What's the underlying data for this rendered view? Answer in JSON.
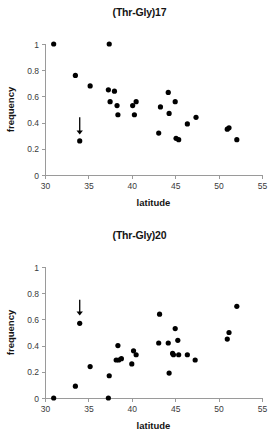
{
  "figure": {
    "background_color": "#ffffff",
    "point_color": "#000000",
    "axis_color": "#9a9a9a",
    "text_color": "#141414"
  },
  "chart_data": [
    {
      "type": "scatter",
      "title": "(Thr-Gly)17",
      "xlabel": "latitude",
      "ylabel": "frequency",
      "xlim": [
        30,
        55
      ],
      "ylim": [
        0,
        1
      ],
      "xticks": [
        30,
        35,
        40,
        45,
        50,
        55
      ],
      "xtick_labels": [
        "30",
        "35",
        "40",
        "45",
        "50",
        "55"
      ],
      "yticks": [
        0,
        0.2,
        0.4,
        0.6,
        0.8,
        1
      ],
      "ytick_labels": [
        "0",
        "0.2",
        "0.4",
        "0.6",
        "0.8",
        "1"
      ],
      "grid": false,
      "legend": "none",
      "trend": "negative",
      "points": [
        {
          "x": 31.0,
          "y": 1.0
        },
        {
          "x": 33.5,
          "y": 0.76
        },
        {
          "x": 34.0,
          "y": 0.26
        },
        {
          "x": 35.2,
          "y": 0.68
        },
        {
          "x": 37.3,
          "y": 0.65
        },
        {
          "x": 37.4,
          "y": 1.0
        },
        {
          "x": 37.5,
          "y": 0.56
        },
        {
          "x": 38.0,
          "y": 0.64
        },
        {
          "x": 38.3,
          "y": 0.53
        },
        {
          "x": 38.4,
          "y": 0.46
        },
        {
          "x": 40.1,
          "y": 0.53
        },
        {
          "x": 40.3,
          "y": 0.46
        },
        {
          "x": 40.5,
          "y": 0.56
        },
        {
          "x": 43.1,
          "y": 0.32
        },
        {
          "x": 43.3,
          "y": 0.52
        },
        {
          "x": 44.2,
          "y": 0.63
        },
        {
          "x": 44.3,
          "y": 0.47
        },
        {
          "x": 45.0,
          "y": 0.56
        },
        {
          "x": 45.1,
          "y": 0.28
        },
        {
          "x": 45.4,
          "y": 0.27
        },
        {
          "x": 46.4,
          "y": 0.39
        },
        {
          "x": 47.4,
          "y": 0.44
        },
        {
          "x": 51.0,
          "y": 0.35
        },
        {
          "x": 51.2,
          "y": 0.36
        },
        {
          "x": 52.1,
          "y": 0.27
        }
      ],
      "annotations": [
        {
          "type": "arrow",
          "label": "down-arrow",
          "x": 34.0,
          "y_from": 0.44,
          "y_to": 0.31
        }
      ]
    },
    {
      "type": "scatter",
      "title": "(Thr-Gly)20",
      "xlabel": "latitude",
      "ylabel": "frequency",
      "xlim": [
        30,
        55
      ],
      "ylim": [
        0,
        1
      ],
      "xticks": [
        30,
        35,
        40,
        45,
        50,
        55
      ],
      "xtick_labels": [
        "30",
        "35",
        "40",
        "45",
        "50",
        "55"
      ],
      "yticks": [
        0,
        0.2,
        0.4,
        0.6,
        0.8,
        1
      ],
      "ytick_labels": [
        "0",
        "0.2",
        "0.4",
        "0.6",
        "0.8",
        "1"
      ],
      "grid": false,
      "legend": "none",
      "trend": "positive",
      "points": [
        {
          "x": 31.0,
          "y": 0.0
        },
        {
          "x": 33.5,
          "y": 0.09
        },
        {
          "x": 34.0,
          "y": 0.57
        },
        {
          "x": 35.2,
          "y": 0.24
        },
        {
          "x": 37.3,
          "y": 0.0
        },
        {
          "x": 37.4,
          "y": 0.17
        },
        {
          "x": 38.2,
          "y": 0.29
        },
        {
          "x": 38.4,
          "y": 0.4
        },
        {
          "x": 38.5,
          "y": 0.29
        },
        {
          "x": 38.8,
          "y": 0.3
        },
        {
          "x": 40.0,
          "y": 0.26
        },
        {
          "x": 40.2,
          "y": 0.36
        },
        {
          "x": 40.5,
          "y": 0.33
        },
        {
          "x": 43.1,
          "y": 0.42
        },
        {
          "x": 43.2,
          "y": 0.64
        },
        {
          "x": 44.2,
          "y": 0.42
        },
        {
          "x": 44.3,
          "y": 0.19
        },
        {
          "x": 44.7,
          "y": 0.34
        },
        {
          "x": 44.8,
          "y": 0.33
        },
        {
          "x": 45.0,
          "y": 0.53
        },
        {
          "x": 45.3,
          "y": 0.44
        },
        {
          "x": 45.4,
          "y": 0.33
        },
        {
          "x": 46.4,
          "y": 0.33
        },
        {
          "x": 47.3,
          "y": 0.29
        },
        {
          "x": 51.0,
          "y": 0.45
        },
        {
          "x": 51.2,
          "y": 0.5
        },
        {
          "x": 52.1,
          "y": 0.7
        }
      ],
      "annotations": [
        {
          "type": "arrow",
          "label": "down-arrow",
          "x": 34.0,
          "y_from": 0.75,
          "y_to": 0.63
        }
      ]
    }
  ]
}
